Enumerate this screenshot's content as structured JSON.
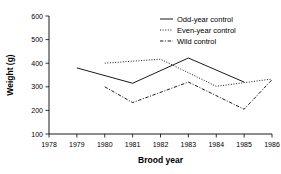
{
  "chart_data": {
    "type": "line",
    "title": "",
    "xlabel": "Brood year",
    "ylabel": "Weight (g)",
    "xlim": [
      1978,
      1986
    ],
    "ylim": [
      100,
      600
    ],
    "xticks": [
      1978,
      1979,
      1980,
      1981,
      1982,
      1983,
      1984,
      1985,
      1986
    ],
    "yticks": [
      100,
      200,
      300,
      400,
      500,
      600
    ],
    "grid": false,
    "legend_position": "top-right",
    "series": [
      {
        "name": "Odd-year control",
        "style": "solid",
        "color": "#000000",
        "x": [
          1979,
          1981,
          1983,
          1985
        ],
        "values": [
          380,
          315,
          422,
          320
        ]
      },
      {
        "name": "Even-year control",
        "style": "dotted",
        "color": "#000000",
        "x": [
          1980,
          1982,
          1984,
          1986
        ],
        "values": [
          400,
          417,
          302,
          333
        ]
      },
      {
        "name": "Wild control",
        "style": "dash-dot",
        "color": "#000000",
        "x": [
          1980,
          1981,
          1983,
          1985,
          1986
        ],
        "values": [
          300,
          233,
          320,
          205,
          330
        ]
      }
    ]
  },
  "axes": {
    "x_title": "Brood year",
    "y_title": "Weight (g)",
    "x_tick_labels": [
      "1978",
      "1979",
      "1980",
      "1981",
      "1982",
      "1983",
      "1984",
      "1985",
      "1986"
    ],
    "y_tick_labels": [
      "100",
      "200",
      "300",
      "400",
      "500",
      "600"
    ]
  },
  "legend": {
    "items": [
      {
        "label": "Odd-year control"
      },
      {
        "label": "Even-year control"
      },
      {
        "label": "Wild control"
      }
    ]
  }
}
